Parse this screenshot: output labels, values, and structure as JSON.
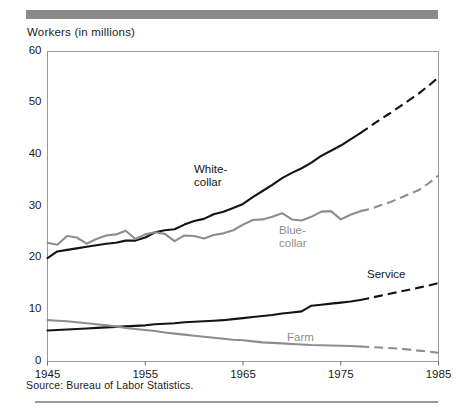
{
  "figure": {
    "axis_title": "Workers (in millions)",
    "source_note": "Source: Bureau of Labor Statistics.",
    "rule_color": "#8a8a8a"
  },
  "chart_data": {
    "type": "line",
    "title": "",
    "subtitle": "",
    "xlabel": "",
    "ylabel": "Workers (in millions)",
    "xlim": [
      1945,
      1985
    ],
    "ylim": [
      0,
      60
    ],
    "grid": false,
    "legend_position": "inline-annotations",
    "x_ticks": [
      "1945",
      "1955",
      "1965",
      "1975",
      "1985"
    ],
    "x_tick_values": [
      1945,
      1955,
      1965,
      1975,
      1985
    ],
    "y_ticks": [
      "0",
      "10",
      "20",
      "30",
      "40",
      "50",
      "60"
    ],
    "y_tick_values": [
      0,
      10,
      20,
      30,
      40,
      50,
      60
    ],
    "projection_start_year": 1977,
    "annotations": [
      {
        "text": "White-\ncollar",
        "line1": "White-",
        "line2": "collar",
        "series": "White-collar",
        "x": 194,
        "y": 163,
        "color": "#141414"
      },
      {
        "text": "Blue-\ncollar",
        "line1": "Blue-",
        "line2": "collar",
        "series": "Blue-collar",
        "x": 279,
        "y": 224,
        "color": "#8d8d8d"
      },
      {
        "text": "Service",
        "line1": "Service",
        "line2": "",
        "series": "Service",
        "x": 367,
        "y": 268,
        "color": "#141414"
      },
      {
        "text": "Farm",
        "line1": "Farm",
        "line2": "",
        "series": "Farm",
        "x": 287,
        "y": 331,
        "color": "#8d8d8d"
      }
    ],
    "series": [
      {
        "name": "White-collar",
        "color": "#141414",
        "style": "solid-then-dashed",
        "x": [
          1945,
          1946,
          1947,
          1948,
          1949,
          1950,
          1951,
          1952,
          1953,
          1954,
          1955,
          1956,
          1957,
          1958,
          1959,
          1960,
          1961,
          1962,
          1963,
          1964,
          1965,
          1966,
          1967,
          1968,
          1969,
          1970,
          1971,
          1972,
          1973,
          1974,
          1975,
          1976,
          1977,
          1978,
          1979,
          1980,
          1981,
          1982,
          1983,
          1984,
          1985
        ],
        "values": [
          20.0,
          21.3,
          21.6,
          21.9,
          22.2,
          22.5,
          22.8,
          23.0,
          23.4,
          23.4,
          24.0,
          25.0,
          25.4,
          25.6,
          26.5,
          27.2,
          27.6,
          28.5,
          29.0,
          29.7,
          30.5,
          31.8,
          33.0,
          34.2,
          35.5,
          36.5,
          37.4,
          38.5,
          39.8,
          40.8,
          41.8,
          43.0,
          44.2,
          45.5,
          46.8,
          48.0,
          49.3,
          50.6,
          51.9,
          53.4,
          55.0
        ]
      },
      {
        "name": "Blue-collar",
        "color": "#8d8d8d",
        "style": "solid-then-dashed",
        "x": [
          1945,
          1946,
          1947,
          1948,
          1949,
          1950,
          1951,
          1952,
          1953,
          1954,
          1955,
          1956,
          1957,
          1958,
          1959,
          1960,
          1961,
          1962,
          1963,
          1964,
          1965,
          1966,
          1967,
          1968,
          1969,
          1970,
          1971,
          1972,
          1973,
          1974,
          1975,
          1976,
          1977,
          1978,
          1979,
          1980,
          1981,
          1982,
          1983,
          1984,
          1985
        ],
        "values": [
          23.0,
          22.6,
          24.3,
          24.0,
          22.8,
          23.7,
          24.4,
          24.6,
          25.3,
          23.7,
          24.6,
          25.0,
          24.7,
          23.3,
          24.4,
          24.3,
          23.8,
          24.5,
          24.8,
          25.4,
          26.5,
          27.4,
          27.5,
          28.0,
          28.7,
          27.5,
          27.3,
          28.0,
          29.0,
          29.1,
          27.5,
          28.4,
          29.1,
          29.5,
          30.2,
          30.8,
          31.6,
          32.4,
          33.2,
          34.5,
          36.0
        ]
      },
      {
        "name": "Service",
        "color": "#141414",
        "style": "solid-then-dashed",
        "x": [
          1945,
          1946,
          1947,
          1948,
          1949,
          1950,
          1951,
          1952,
          1953,
          1954,
          1955,
          1956,
          1957,
          1958,
          1959,
          1960,
          1961,
          1962,
          1963,
          1964,
          1965,
          1966,
          1967,
          1968,
          1969,
          1970,
          1971,
          1972,
          1973,
          1974,
          1975,
          1976,
          1977,
          1978,
          1979,
          1980,
          1981,
          1982,
          1983,
          1984,
          1985
        ],
        "values": [
          6.0,
          6.1,
          6.2,
          6.3,
          6.4,
          6.5,
          6.6,
          6.7,
          6.8,
          6.9,
          7.0,
          7.2,
          7.3,
          7.4,
          7.6,
          7.7,
          7.8,
          7.9,
          8.0,
          8.2,
          8.4,
          8.6,
          8.8,
          9.0,
          9.3,
          9.5,
          9.7,
          10.8,
          11.0,
          11.2,
          11.4,
          11.6,
          11.9,
          12.3,
          12.7,
          13.1,
          13.5,
          13.9,
          14.3,
          14.7,
          15.2
        ]
      },
      {
        "name": "Farm",
        "color": "#8d8d8d",
        "style": "solid-then-dashed",
        "x": [
          1945,
          1946,
          1947,
          1948,
          1949,
          1950,
          1951,
          1952,
          1953,
          1954,
          1955,
          1956,
          1957,
          1958,
          1959,
          1960,
          1961,
          1962,
          1963,
          1964,
          1965,
          1966,
          1967,
          1968,
          1969,
          1970,
          1971,
          1972,
          1973,
          1974,
          1975,
          1976,
          1977,
          1978,
          1979,
          1980,
          1981,
          1982,
          1983,
          1984,
          1985
        ],
        "values": [
          8.0,
          7.9,
          7.8,
          7.6,
          7.4,
          7.2,
          7.0,
          6.8,
          6.5,
          6.3,
          6.1,
          5.9,
          5.6,
          5.4,
          5.2,
          5.0,
          4.8,
          4.6,
          4.4,
          4.2,
          4.1,
          3.9,
          3.7,
          3.6,
          3.5,
          3.4,
          3.3,
          3.2,
          3.15,
          3.1,
          3.05,
          3.0,
          2.9,
          2.8,
          2.7,
          2.6,
          2.5,
          2.3,
          2.1,
          1.9,
          1.7
        ]
      }
    ]
  }
}
